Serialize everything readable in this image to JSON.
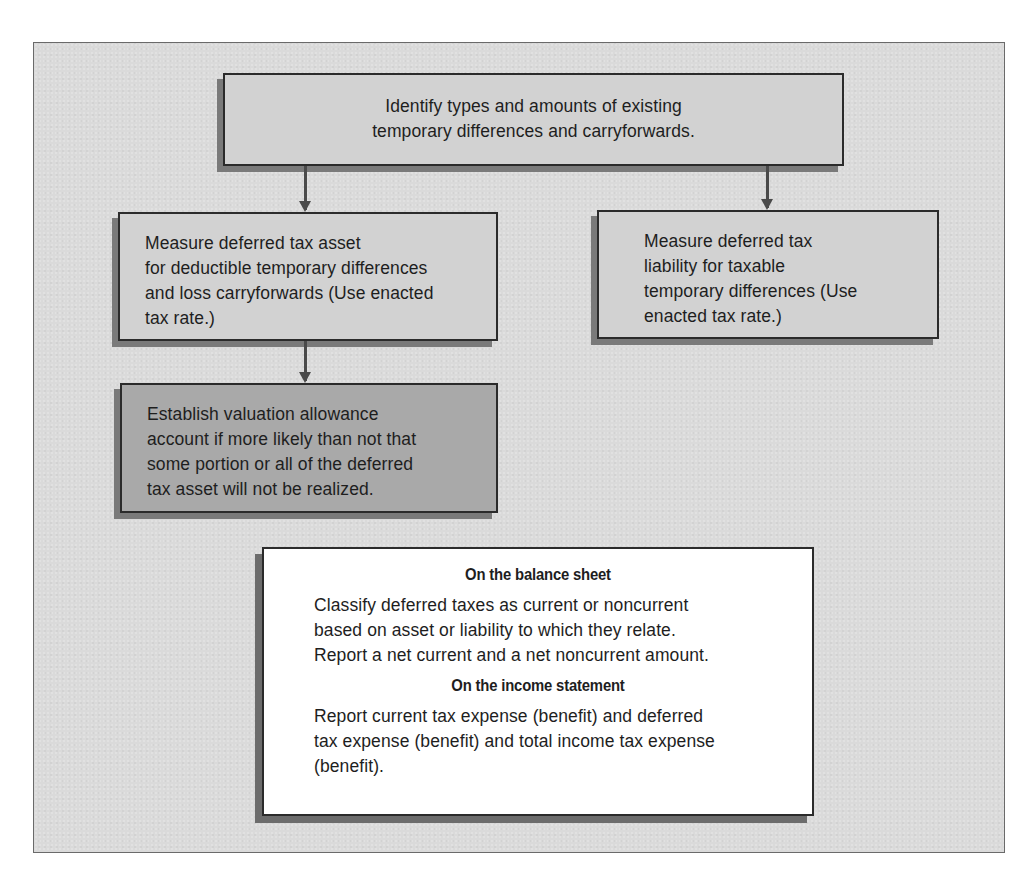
{
  "diagram": {
    "type": "flowchart",
    "colors": {
      "panel_background": "#dadada",
      "light_box": "#d2d2d2",
      "dark_box": "#a9a9a9",
      "summary_box": "#ffffff",
      "border": "#2b2b2b",
      "arrow": "#4a4a4a"
    },
    "nodes": {
      "identify": {
        "lines": [
          "Identify types and amounts of existing",
          "temporary differences and carryforwards."
        ]
      },
      "asset": {
        "lines": [
          "Measure deferred tax asset",
          "for deductible temporary differences",
          "and loss carryforwards (Use enacted",
          "tax rate.)"
        ]
      },
      "liability": {
        "lines": [
          "Measure deferred tax",
          "liability for taxable",
          "temporary differences (Use",
          "enacted tax rate.)"
        ]
      },
      "valuation": {
        "lines": [
          "Establish valuation allowance",
          "account if more likely than not that",
          "some portion or all of the deferred",
          "tax asset will not be realized."
        ]
      },
      "summary": {
        "balance_sheet_heading": "On the balance sheet",
        "balance_sheet_lines": [
          "Classify deferred taxes as current or noncurrent",
          "based on asset or liability to which they relate.",
          "Report a net current and a net noncurrent amount."
        ],
        "income_statement_heading": "On the income statement",
        "income_statement_lines": [
          "Report current tax expense (benefit) and deferred",
          "tax expense (benefit) and total income tax expense",
          "(benefit)."
        ]
      }
    },
    "edges": [
      {
        "from": "identify",
        "to": "asset"
      },
      {
        "from": "identify",
        "to": "liability"
      },
      {
        "from": "asset",
        "to": "valuation"
      }
    ]
  }
}
